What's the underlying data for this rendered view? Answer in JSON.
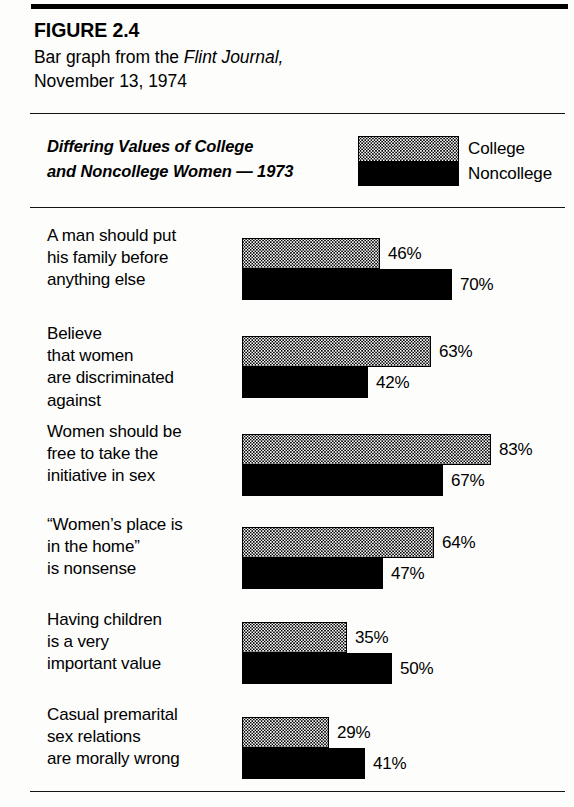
{
  "figure": {
    "number_label": "FIGURE 2.4",
    "caption_prefix": "Bar graph from the ",
    "caption_source": "Flint Journal,",
    "caption_date": "November 13, 1974"
  },
  "legend": {
    "swatch_name": "stacked-college-noncollege-swatch",
    "college_label": "College",
    "noncollege_label": "Noncollege",
    "college_fill": "stipple-dots",
    "noncollege_fill": "#000000"
  },
  "chart_data": {
    "type": "bar",
    "orientation": "horizontal",
    "title": "Differing Values of College",
    "title_line2": "and Noncollege Women — 1973",
    "xlabel": "",
    "ylabel": "",
    "xlim": [
      0,
      100
    ],
    "grid": false,
    "legend_position": "top-right",
    "value_suffix": "%",
    "px_per_unit": 3.0,
    "categories": [
      "A man should put his family before anything else",
      "Believe that women are discriminated against",
      "Women should be free to take the initiative in sex",
      "“Women’s place is in the home” is nonsense",
      "Having children is a very important value",
      "Casual premarital sex relations are morally wrong"
    ],
    "category_lines": [
      [
        "A man should put",
        "his family before",
        "anything else"
      ],
      [
        "Believe",
        "that women",
        "are discriminated",
        "against"
      ],
      [
        "Women should be",
        "free to take the",
        "initiative in sex"
      ],
      [
        "“Women’s place is",
        "in the home”",
        "is nonsense"
      ],
      [
        "Having children",
        "is a very",
        "important value"
      ],
      [
        "Casual premarital",
        "sex relations",
        "are morally wrong"
      ]
    ],
    "series": [
      {
        "name": "College",
        "values": [
          46,
          63,
          83,
          64,
          35,
          29
        ],
        "labels": [
          "46%",
          "63%",
          "83%",
          "64%",
          "35%",
          "29%"
        ]
      },
      {
        "name": "Noncollege",
        "values": [
          70,
          42,
          67,
          47,
          50,
          41
        ],
        "labels": [
          "70%",
          "42%",
          "67%",
          "47%",
          "50%",
          "41%"
        ]
      }
    ]
  },
  "groups": [
    {
      "top": 6,
      "lines": [
        "A man should put",
        "his family before",
        "anything else"
      ],
      "college": {
        "value": 46,
        "label": "46%"
      },
      "noncollege": {
        "value": 70,
        "label": "70%"
      }
    },
    {
      "top": 104,
      "lines": [
        "Believe",
        "that women",
        "are discriminated",
        "against"
      ],
      "college": {
        "value": 63,
        "label": "63%"
      },
      "noncollege": {
        "value": 42,
        "label": "42%"
      }
    },
    {
      "top": 202,
      "lines": [
        "Women should be",
        "free to take the",
        "initiative in sex"
      ],
      "college": {
        "value": 83,
        "label": "83%"
      },
      "noncollege": {
        "value": 67,
        "label": "67%"
      }
    },
    {
      "top": 295,
      "lines": [
        "“Women’s place is",
        "in the home”",
        "is nonsense"
      ],
      "college": {
        "value": 64,
        "label": "64%"
      },
      "noncollege": {
        "value": 47,
        "label": "47%"
      }
    },
    {
      "top": 390,
      "lines": [
        "Having children",
        "is a very",
        "important value"
      ],
      "college": {
        "value": 35,
        "label": "35%"
      },
      "noncollege": {
        "value": 50,
        "label": "50%"
      }
    },
    {
      "top": 485,
      "lines": [
        "Casual premarital",
        "sex relations",
        "are morally wrong"
      ],
      "college": {
        "value": 29,
        "label": "29%"
      },
      "noncollege": {
        "value": 41,
        "label": "41%"
      }
    }
  ]
}
